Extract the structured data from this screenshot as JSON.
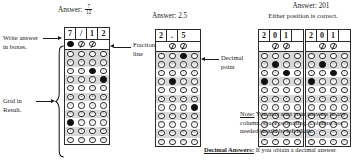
{
  "labels": {
    "write_answer_line1": "Write answer",
    "write_answer_line2": "in boxes.",
    "grid_in_line1": "Grid in",
    "grid_in_line2": "Result.",
    "fraction_line1": "Fraction",
    "fraction_line2": "line",
    "decimal_line1": "Decimal",
    "decimal_line2": "point"
  },
  "examples": [
    {
      "id": "fraction-example",
      "answer_prefix": "Answer:",
      "answer_numerator": "7",
      "answer_denominator": "12",
      "entries": [
        "7",
        "/",
        "1",
        "2"
      ],
      "grid": {
        "slash_row": [
          "filled",
          "slash",
          "slash",
          "blank"
        ],
        "dot_row": [
          "dot",
          "dot",
          "dot",
          "dot"
        ],
        "digit_rows": [
          {
            "digit": "0",
            "marks": [
              false,
              false,
              false,
              false
            ]
          },
          {
            "digit": "1",
            "marks": [
              false,
              false,
              true,
              false
            ]
          },
          {
            "digit": "2",
            "marks": [
              false,
              false,
              false,
              true
            ]
          },
          {
            "digit": "3",
            "marks": [
              false,
              false,
              false,
              false
            ]
          },
          {
            "digit": "4",
            "marks": [
              false,
              false,
              false,
              false
            ]
          },
          {
            "digit": "5",
            "marks": [
              false,
              false,
              false,
              false
            ]
          },
          {
            "digit": "6",
            "marks": [
              false,
              false,
              false,
              false
            ]
          },
          {
            "digit": "7",
            "marks": [
              true,
              false,
              false,
              false
            ]
          },
          {
            "digit": "8",
            "marks": [
              false,
              false,
              false,
              false
            ]
          },
          {
            "digit": "9",
            "marks": [
              false,
              false,
              false,
              false
            ]
          }
        ]
      }
    },
    {
      "id": "decimal-example",
      "answer_prefix": "Answer:",
      "answer_value": "2.5",
      "entries": [
        "2",
        ".",
        "5"
      ],
      "grid": {
        "slash_row": [
          "blank",
          "slash",
          "slash",
          "blank"
        ],
        "dot_row": [
          "dot",
          "dot",
          "filled",
          "dot"
        ],
        "digit_rows": [
          {
            "digit": "0",
            "marks": [
              false,
              false,
              false,
              false
            ]
          },
          {
            "digit": "1",
            "marks": [
              false,
              false,
              false,
              false
            ]
          },
          {
            "digit": "2",
            "marks": [
              false,
              true,
              false,
              false
            ]
          },
          {
            "digit": "3",
            "marks": [
              false,
              false,
              false,
              false
            ]
          },
          {
            "digit": "4",
            "marks": [
              false,
              false,
              false,
              false
            ]
          },
          {
            "digit": "5",
            "marks": [
              false,
              false,
              false,
              true
            ]
          },
          {
            "digit": "6",
            "marks": [
              false,
              false,
              false,
              false
            ]
          },
          {
            "digit": "7",
            "marks": [
              false,
              false,
              false,
              false
            ]
          },
          {
            "digit": "8",
            "marks": [
              false,
              false,
              false,
              false
            ]
          },
          {
            "digit": "9",
            "marks": [
              false,
              false,
              false,
              false
            ]
          }
        ]
      }
    },
    {
      "id": "integer-example-left",
      "entries": [
        "2",
        "0",
        "1",
        ""
      ],
      "grid": {
        "slash_row": [
          "blank",
          "slash",
          "slash",
          "blank"
        ],
        "dot_row": [
          "dot",
          "dot",
          "dot",
          "dot"
        ],
        "digit_rows": [
          {
            "digit": "0",
            "marks": [
              false,
              true,
              false,
              false
            ]
          },
          {
            "digit": "1",
            "marks": [
              false,
              false,
              true,
              false
            ]
          },
          {
            "digit": "2",
            "marks": [
              true,
              false,
              false,
              false
            ]
          },
          {
            "digit": "3",
            "marks": [
              false,
              false,
              false,
              false
            ]
          },
          {
            "digit": "4",
            "marks": [
              false,
              false,
              false,
              false
            ]
          },
          {
            "digit": "5",
            "marks": [
              false,
              false,
              false,
              false
            ]
          },
          {
            "digit": "6",
            "marks": [
              false,
              false,
              false,
              false
            ]
          },
          {
            "digit": "7",
            "marks": [
              false,
              false,
              false,
              false
            ]
          },
          {
            "digit": "8",
            "marks": [
              false,
              false,
              false,
              false
            ]
          },
          {
            "digit": "9",
            "marks": [
              false,
              false,
              false,
              false
            ]
          }
        ]
      }
    },
    {
      "id": "integer-example-right",
      "entries": [
        "2",
        "0",
        "1",
        ""
      ],
      "grid": {
        "slash_row": [
          "blank",
          "slash",
          "slash",
          "blank"
        ],
        "dot_row": [
          "dot",
          "dot",
          "dot",
          "dot"
        ],
        "digit_rows": [
          {
            "digit": "0",
            "marks": [
              false,
              true,
              false,
              false
            ]
          },
          {
            "digit": "1",
            "marks": [
              false,
              false,
              true,
              false
            ]
          },
          {
            "digit": "2",
            "marks": [
              true,
              false,
              false,
              false
            ]
          },
          {
            "digit": "3",
            "marks": [
              false,
              false,
              false,
              false
            ]
          },
          {
            "digit": "4",
            "marks": [
              false,
              false,
              false,
              false
            ]
          },
          {
            "digit": "5",
            "marks": [
              false,
              false,
              false,
              false
            ]
          },
          {
            "digit": "6",
            "marks": [
              false,
              false,
              false,
              false
            ]
          },
          {
            "digit": "7",
            "marks": [
              false,
              false,
              false,
              false
            ]
          },
          {
            "digit": "8",
            "marks": [
              false,
              false,
              false,
              false
            ]
          },
          {
            "digit": "9",
            "marks": [
              false,
              false,
              false,
              false
            ]
          }
        ]
      }
    }
  ],
  "integer_header": {
    "line1": "Answer:  201",
    "line2": "Either position is correct."
  },
  "note": {
    "label": "Note:",
    "body": "You may start your answers in any column, space permitting.  Columns not needed should be left blank."
  },
  "decimal_note": {
    "label": "Decimal Answers:",
    "body": "If you obtain a decimal answer"
  },
  "colors": {
    "ink": "#1a1a1a",
    "rule": "#2b2b2b",
    "shade": "#d9d9d9",
    "fill": "#111111"
  }
}
